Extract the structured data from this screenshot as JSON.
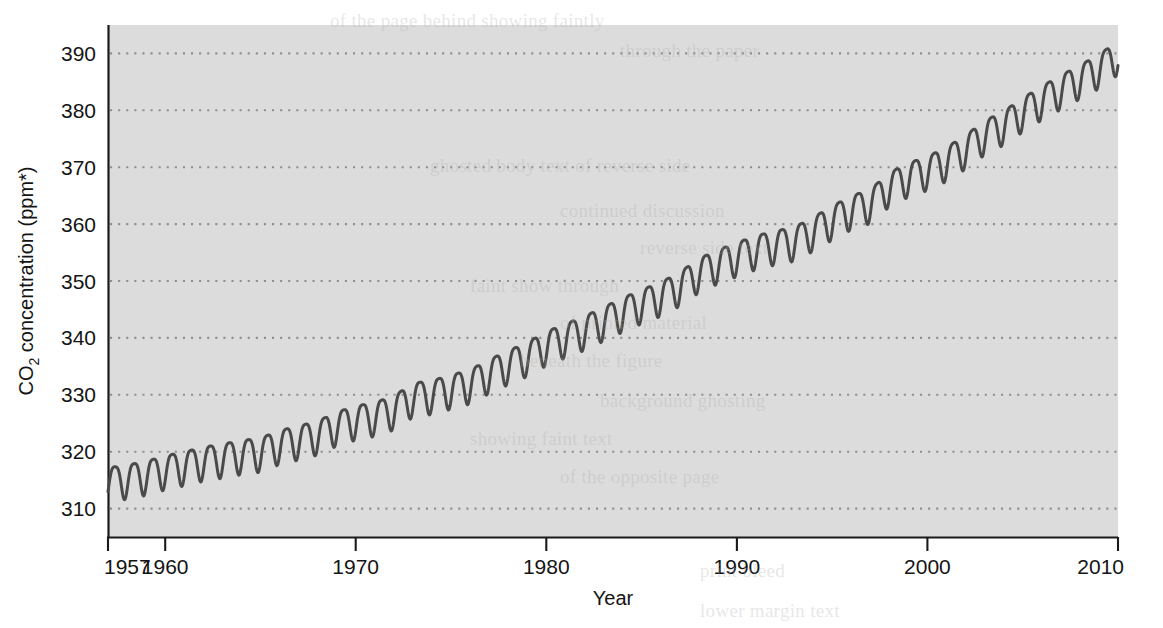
{
  "chart_data": {
    "type": "line",
    "title": "",
    "subtitle": "",
    "xlabel": "Year",
    "ylabel": "CO2 concentration (ppm*)",
    "ylabel_parts": {
      "prefix": "CO",
      "subscript": "2",
      "suffix": " concentration (ppm*)"
    },
    "xlim": [
      1957,
      2010
    ],
    "ylim": [
      305,
      395
    ],
    "xticks": [
      1957,
      1960,
      1970,
      1980,
      1990,
      2000,
      2010
    ],
    "xtick_labels": [
      "1957",
      "1960",
      "1970",
      "1980",
      "1990",
      "2000",
      "2010"
    ],
    "yticks": [
      310,
      320,
      330,
      340,
      350,
      360,
      370,
      380,
      390
    ],
    "ytick_labels": [
      "310",
      "320",
      "330",
      "340",
      "350",
      "360",
      "370",
      "380",
      "390"
    ],
    "grid": {
      "horizontal": true,
      "vertical": false,
      "style": "dotted",
      "color": "#8f8f8f"
    },
    "legend": {
      "visible": false,
      "position": "none"
    },
    "plot_background": "#dcdcdc",
    "line_color": "#4a4a4a",
    "line_width": 3,
    "series": [
      {
        "name": "Atmospheric CO2 (Mauna Loa)",
        "description": "Monthly mean CO2 concentration with seasonal oscillation superimposed on a rising trend",
        "seasonal_amplitude_ppm": 3.0,
        "x": [
          1957.5,
          1958,
          1959,
          1960,
          1961,
          1962,
          1963,
          1964,
          1965,
          1966,
          1967,
          1968,
          1969,
          1970,
          1971,
          1972,
          1973,
          1974,
          1975,
          1976,
          1977,
          1978,
          1979,
          1980,
          1981,
          1982,
          1983,
          1984,
          1985,
          1986,
          1987,
          1988,
          1989,
          1990,
          1991,
          1992,
          1993,
          1994,
          1995,
          1996,
          1997,
          1998,
          1999,
          2000,
          2001,
          2002,
          2003,
          2004,
          2005,
          2006,
          2007,
          2008,
          2009,
          2010
        ],
        "annual_mean_values": [
          315.0,
          315.3,
          315.98,
          316.91,
          317.64,
          318.45,
          318.99,
          319.62,
          320.04,
          321.38,
          322.16,
          323.04,
          324.62,
          325.68,
          326.32,
          327.45,
          329.68,
          330.18,
          331.11,
          332.04,
          333.83,
          335.4,
          336.84,
          338.75,
          340.11,
          341.45,
          343.05,
          344.65,
          346.12,
          347.42,
          349.19,
          351.57,
          353.12,
          354.39,
          355.61,
          356.45,
          357.1,
          358.83,
          360.82,
          362.61,
          363.73,
          366.7,
          368.38,
          369.55,
          371.14,
          373.28,
          375.8,
          377.52,
          379.8,
          381.9,
          383.79,
          385.6,
          387.43,
          389.9
        ]
      }
    ],
    "footnote_marker": "*"
  },
  "axis": {
    "y_title_prefix": "CO",
    "y_title_sub": "2",
    "y_title_suffix": " concentration (ppm*)",
    "x_title": "Year"
  },
  "bleedthrough_text": [
    {
      "text": "of the page behind showing faintly",
      "x": 330,
      "y": 10
    },
    {
      "text": "through the paper",
      "x": 620,
      "y": 40
    },
    {
      "text": "ghosted body text of reverse side",
      "x": 430,
      "y": 155
    },
    {
      "text": "continued discussion",
      "x": 560,
      "y": 200
    },
    {
      "text": "reverse side text",
      "x": 640,
      "y": 237
    },
    {
      "text": "faint show through",
      "x": 470,
      "y": 275
    },
    {
      "text": "of printed material",
      "x": 560,
      "y": 312
    },
    {
      "text": "beneath the figure",
      "x": 520,
      "y": 350
    },
    {
      "text": "background ghosting",
      "x": 600,
      "y": 390
    },
    {
      "text": "showing faint text",
      "x": 470,
      "y": 428
    },
    {
      "text": "of the opposite page",
      "x": 560,
      "y": 466
    },
    {
      "text": "print bleed",
      "x": 700,
      "y": 560
    },
    {
      "text": "lower margin text",
      "x": 700,
      "y": 600
    }
  ]
}
